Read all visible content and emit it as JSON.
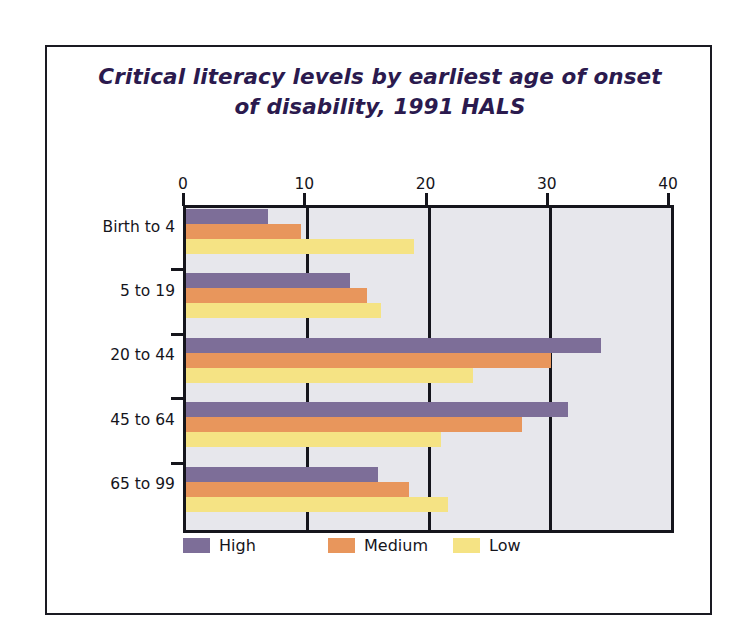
{
  "chart_data": {
    "type": "bar",
    "orientation": "horizontal",
    "title": "Critical literacy levels by earliest age of onset of disability, 1991 HALS",
    "title_lines": [
      "Critical literacy levels by earliest age of onset",
      "of disability, 1991 HALS"
    ],
    "xlabel": "",
    "ylabel": "",
    "xlim": [
      0,
      40
    ],
    "xticks": [
      0,
      10,
      20,
      30,
      40
    ],
    "xtick_labels": [
      "0",
      "10",
      "20",
      "30",
      "40"
    ],
    "grid": true,
    "grid_axis": "x",
    "legend_position": "bottom",
    "categories": [
      "Birth to 4",
      "5 to 19",
      "20 to 44",
      "45 to 64",
      "65 to 99"
    ],
    "series": [
      {
        "name": "High",
        "color": "#7d6e98",
        "values": [
          6.8,
          13.5,
          34.2,
          31.5,
          15.8
        ]
      },
      {
        "name": "Medium",
        "color": "#e8965c",
        "values": [
          9.5,
          14.9,
          30.1,
          27.7,
          18.4
        ]
      },
      {
        "name": "Low",
        "color": "#f5e384",
        "values": [
          18.8,
          16.1,
          23.7,
          21.0,
          21.6
        ]
      }
    ]
  },
  "style": {
    "plot_background": "#e7e7ec",
    "axis_color": "#15151c",
    "title_color": "#2b1a4e",
    "frame_color": "#1a1a22",
    "page_background": "#ffffff"
  }
}
